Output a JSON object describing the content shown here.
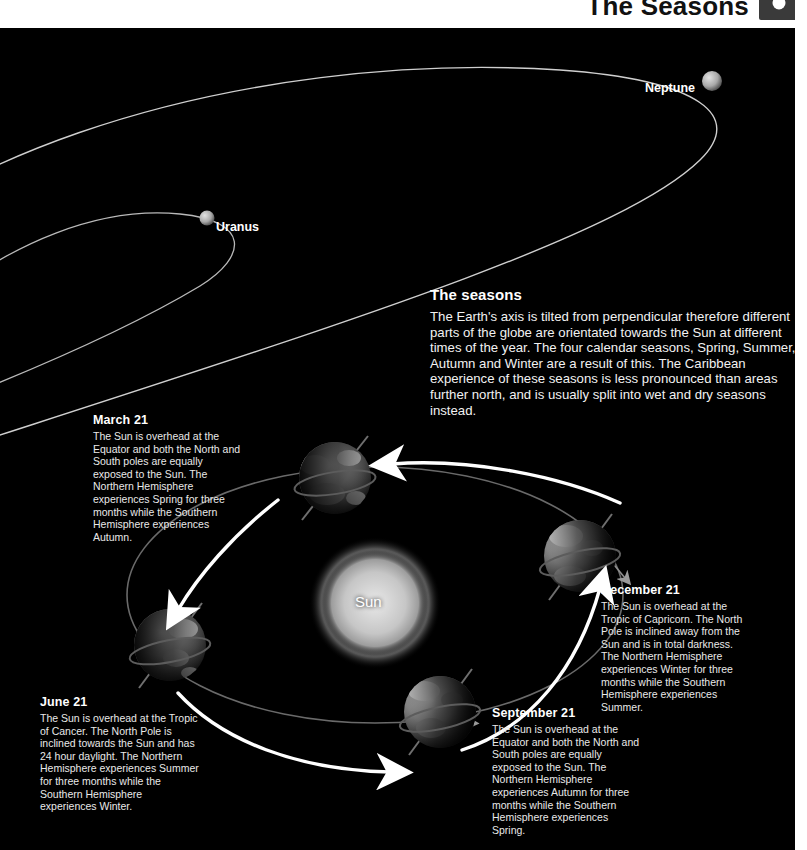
{
  "header": {
    "title": "The Seasons",
    "page_badge_icon": "circle-dot-icon"
  },
  "plate": {
    "background_color": "#000000",
    "orbit_line_color": "#c8c8c8",
    "arrow_color": "#ffffff"
  },
  "planets": [
    {
      "name": "Neptune",
      "label": "Neptune",
      "cx": 712,
      "cy": 81,
      "r": 9
    },
    {
      "name": "Uranus",
      "label": "Uranus",
      "cx": 207,
      "cy": 218,
      "r": 7
    }
  ],
  "sun": {
    "label": "Sun",
    "cx": 375,
    "cy": 603,
    "r": 53,
    "color": "#c9c9c9"
  },
  "earths": [
    {
      "position": "march",
      "cx": 335,
      "cy": 478,
      "r": 36
    },
    {
      "position": "december",
      "cx": 580,
      "cy": 556,
      "r": 36
    },
    {
      "position": "june",
      "cx": 170,
      "cy": 645,
      "r": 36
    },
    {
      "position": "september",
      "cx": 440,
      "cy": 712,
      "r": 36
    }
  ],
  "seasons_panel": {
    "title": "The seasons",
    "body": "The Earth's axis is tilted from perpendicular therefore different parts of the globe are orientated towards the Sun at different times of the year. The four calendar seasons, Spring, Summer, Autumn and Winter are a result of this. The Caribbean experience of these seasons is less pronounced than areas further north, and is usually split into wet and dry seasons instead."
  },
  "annotations": {
    "march": {
      "title": "March 21",
      "body": "The Sun is overhead at the Equator and both the North and South poles are equally exposed to the Sun. The Northern Hemisphere experiences Spring for three months while the Southern Hemisphere experiences Autumn."
    },
    "june": {
      "title": "June 21",
      "body": "The Sun is overhead at the Tropic of Cancer. The North Pole is inclined towards the Sun and has 24 hour daylight. The Northern Hemisphere experiences Summer for three months while the Southern Hemisphere experiences Winter."
    },
    "september": {
      "title": "September 21",
      "body": "The Sun is overhead at the Equator and both the North and South poles are equally exposed to the Sun. The Northern Hemisphere experiences Autumn for three months while the Southern Hemisphere experiences Spring."
    },
    "december": {
      "title": "December 21",
      "body": "The Sun is overhead at the Tropic of Capricorn. The North Pole is inclined away from the Sun and is in total darkness. The Northern Hemisphere experiences Winter for three months while the Southern Hemisphere experiences Summer."
    }
  }
}
